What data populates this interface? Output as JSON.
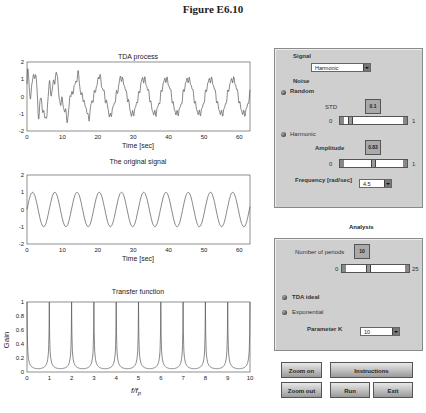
{
  "figure_title": "Figure E6.10",
  "plots": {
    "tda": {
      "title": "TDA process",
      "xlabel": "Time [sec]",
      "yticks": [
        "2",
        "1",
        "0",
        "-1",
        "-2"
      ],
      "xticks": [
        "0",
        "10",
        "20",
        "30",
        "40",
        "50",
        "60"
      ]
    },
    "original": {
      "title": "The original signal",
      "xlabel": "Time [sec]",
      "yticks": [
        "2",
        "1",
        "0",
        "-1",
        "-2"
      ],
      "xticks": [
        "0",
        "10",
        "20",
        "30",
        "40",
        "50",
        "60"
      ]
    },
    "transfer": {
      "title": "Transfer function",
      "xlabel": "f/f",
      "xlabel_sub": "p",
      "ylabel": "Gain",
      "yticks": [
        "1",
        "0.8",
        "0.6",
        "0.4",
        "0.2",
        "0"
      ],
      "xticks": [
        "0",
        "1",
        "2",
        "3",
        "4",
        "5",
        "6",
        "7",
        "8",
        "9",
        "10"
      ]
    }
  },
  "signal_panel": {
    "signal_label": "Signal",
    "signal_value": "Harmonic",
    "noise_label": "Noise",
    "random_label": "Random",
    "std_label": "STD",
    "std_value": "0.1",
    "std_min": "0",
    "std_max": "1",
    "harmonic_label": "Harmonic",
    "amplitude_label": "Amplitude",
    "amplitude_value": "0.83",
    "amp_min": "0",
    "amp_max": "1",
    "frequency_label": "Frequency [rad/sec]",
    "frequency_value": "4.5"
  },
  "analysis": {
    "title": "Analysis",
    "periods_label": "Number of periods",
    "periods_value": "10",
    "periods_min": "0",
    "periods_max": "25",
    "tda_ideal_label": "TDA ideal",
    "exponential_label": "Exponential",
    "param_k_label": "Parameter K",
    "param_k_value": "10"
  },
  "buttons": {
    "zoom_on": "Zoom on",
    "instructions": "Instructions",
    "zoom_out": "Zoom out",
    "run": "Run",
    "exit": "Exit"
  },
  "chart_data": [
    {
      "type": "line",
      "title": "TDA process",
      "xlabel": "Time [sec]",
      "ylabel": "",
      "xlim": [
        0,
        63
      ],
      "ylim": [
        -2,
        2
      ],
      "description": "noisy harmonic converging to sinusoid, period ~6.28s, amplitude ~1 with transient peaks up to 1.8 and -1.7 in first 10s"
    },
    {
      "type": "line",
      "title": "The original signal",
      "xlabel": "Time [sec]",
      "ylabel": "",
      "xlim": [
        0,
        63
      ],
      "ylim": [
        -2,
        2
      ],
      "series": [
        {
          "name": "sin",
          "amplitude": 1,
          "period": 6.28
        }
      ]
    },
    {
      "type": "line",
      "title": "Transfer function",
      "xlabel": "f/f_p",
      "ylabel": "Gain",
      "xlim": [
        0,
        10
      ],
      "ylim": [
        0,
        1
      ],
      "x": [
        0,
        1,
        2,
        3,
        4,
        5,
        6,
        7,
        8,
        9,
        10
      ],
      "values": [
        1,
        1,
        1,
        1,
        1,
        1,
        1,
        1,
        1,
        1,
        1
      ],
      "note": "peaks of gain 1 at integer f/f_p, minima ~0.05 between"
    }
  ]
}
